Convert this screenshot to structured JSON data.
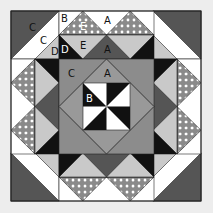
{
  "diagram": {
    "colors": {
      "background": "#ededed",
      "dark_gray": "#555555",
      "medium_gray": "#8c8c8c",
      "light_gray": "#c9c9c9",
      "black": "#111111",
      "white": "#ffffff",
      "polka_base": "#8a8a8a",
      "polka_dot": "#ffffff",
      "outline": "#222222"
    },
    "labels": [
      {
        "text": "C",
        "x": 29,
        "y": 31,
        "color": "#111111"
      },
      {
        "text": "C",
        "x": 40,
        "y": 44,
        "color": "#111111"
      },
      {
        "text": "D",
        "x": 51,
        "y": 55,
        "color": "#111111"
      },
      {
        "text": "B",
        "x": 64,
        "y": 22,
        "color": "#111111"
      },
      {
        "text": "E",
        "x": 83,
        "y": 29,
        "color": "#ffffff"
      },
      {
        "text": "A",
        "x": 106,
        "y": 24,
        "color": "#111111"
      },
      {
        "text": "D",
        "x": 64,
        "y": 53,
        "color": "#ffffff"
      },
      {
        "text": "E",
        "x": 83,
        "y": 49,
        "color": "#111111"
      },
      {
        "text": "A",
        "x": 106,
        "y": 53,
        "color": "#111111"
      },
      {
        "text": "C",
        "x": 71,
        "y": 76,
        "color": "#111111"
      },
      {
        "text": "A",
        "x": 106,
        "y": 76,
        "color": "#111111"
      },
      {
        "text": "B",
        "x": 100,
        "y": 91,
        "color": "#ffffff"
      },
      {
        "text": "B",
        "x": 89,
        "y": 101,
        "color": "#ffffff"
      }
    ]
  }
}
